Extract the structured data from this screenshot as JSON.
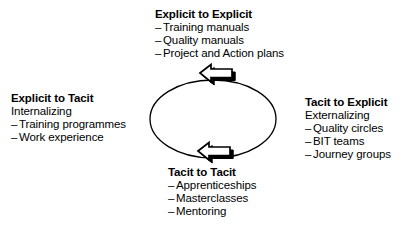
{
  "diagram": {
    "shape": "ellipse-cycle",
    "stroke_color": "#000000",
    "background_color": "#ffffff"
  },
  "cycle": {
    "ellipse": {
      "name": "cycle-ellipse",
      "cx": 213,
      "cy": 119,
      "rx": 63,
      "ry": 39
    },
    "arrows": [
      {
        "name": "top-arrow",
        "direction": "left",
        "style": "hollow-block-arrow-with-shadow"
      },
      {
        "name": "bottom-arrow",
        "direction": "left",
        "style": "hollow-block-arrow-with-shadow"
      }
    ]
  },
  "blocks": {
    "explicit_to_explicit": {
      "heading": "Explicit to Explicit",
      "subtitle": "",
      "items": [
        "Training manuals",
        "Quality manuals",
        "Project and Action plans"
      ]
    },
    "explicit_to_tacit": {
      "heading": "Explicit to Tacit",
      "subtitle": "Internalizing",
      "items": [
        "Training programmes",
        "Work experience"
      ]
    },
    "tacit_to_explicit": {
      "heading": "Tacit to Explicit",
      "subtitle": "Externalizing",
      "items": [
        "Quality circles",
        "BIT teams",
        "Journey groups"
      ]
    },
    "tacit_to_tacit": {
      "heading": "Tacit to Tacit",
      "subtitle": "",
      "items": [
        "Apprenticeships",
        "Masterclasses",
        "Mentoring"
      ]
    }
  }
}
